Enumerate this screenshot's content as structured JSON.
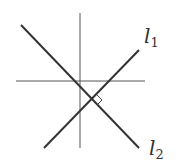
{
  "diagram": {
    "labels": {
      "l1": {
        "base": "l",
        "sub": "1"
      },
      "l2": {
        "base": "l",
        "sub": "2"
      }
    },
    "colors": {
      "line": "#333333",
      "axis": "#555555",
      "background": "#ffffff"
    }
  }
}
